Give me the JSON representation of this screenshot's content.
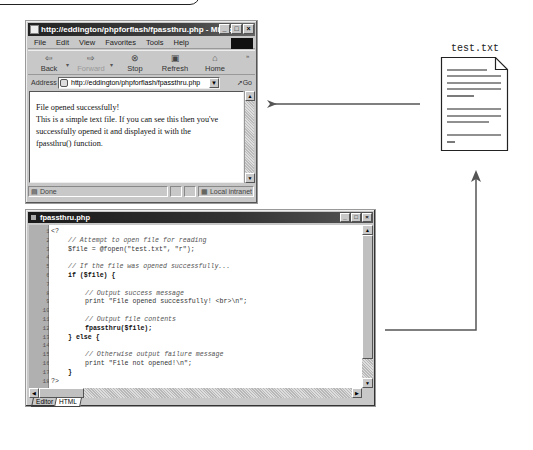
{
  "browser": {
    "title": "http://eddington/phpforflash/fpassthru.php - Micro...",
    "window_buttons": [
      "_",
      "□",
      "×"
    ],
    "menu": [
      "File",
      "Edit",
      "View",
      "Favorites",
      "Tools",
      "Help"
    ],
    "toolbar": {
      "back": "Back",
      "forward": "Forward",
      "stop": "Stop",
      "refresh": "Refresh",
      "home": "Home"
    },
    "address_label": "Address",
    "address_value": "http://eddington/phpforflash/fpassthru.php",
    "go_label": "Go",
    "content_lines": [
      "File opened successfully!",
      "This is a simple text file. If you can see this then you've",
      "successfully opened it and displayed it with the",
      "fpassthru() function."
    ],
    "status_text": "Done",
    "zone_text": "Local intranet"
  },
  "document": {
    "label": "test.txt"
  },
  "editor": {
    "title": "fpassthru.php",
    "window_buttons": [
      "_",
      "□",
      "×"
    ],
    "lines": [
      {
        "n": "1",
        "text": "<?",
        "type": "plain",
        "indent": 0
      },
      {
        "n": "2",
        "text": "// Attempt to open file for reading",
        "type": "cmt",
        "indent": 1
      },
      {
        "n": "3",
        "text": "$file = @fopen(\"test.txt\", \"r\");",
        "type": "plain",
        "indent": 1
      },
      {
        "n": "4",
        "text": "",
        "type": "plain",
        "indent": 0
      },
      {
        "n": "5",
        "text": "// If the file was opened successfully...",
        "type": "cmt",
        "indent": 1
      },
      {
        "n": "6",
        "text": "if ($file) {",
        "type": "kw",
        "indent": 1
      },
      {
        "n": "7",
        "text": "",
        "type": "plain",
        "indent": 0
      },
      {
        "n": "8",
        "text": "// Output success message",
        "type": "cmt",
        "indent": 2
      },
      {
        "n": "9",
        "text": "print \"File opened successfully! <br>\\n\";",
        "type": "plain",
        "indent": 2
      },
      {
        "n": "10",
        "text": "",
        "type": "plain",
        "indent": 0
      },
      {
        "n": "11",
        "text": "// Output file contents",
        "type": "cmt",
        "indent": 2
      },
      {
        "n": "12",
        "text": "fpassthru($file);",
        "type": "kw",
        "indent": 2
      },
      {
        "n": "13",
        "text": "} else {",
        "type": "kw",
        "indent": 1
      },
      {
        "n": "14",
        "text": "",
        "type": "plain",
        "indent": 0
      },
      {
        "n": "15",
        "text": "// Otherwise output failure message",
        "type": "cmt",
        "indent": 2
      },
      {
        "n": "16",
        "text": "print \"File not opened!\\n\";",
        "type": "plain",
        "indent": 2
      },
      {
        "n": "17",
        "text": "}",
        "type": "kw",
        "indent": 1
      },
      {
        "n": "18",
        "text": "?>",
        "type": "plain",
        "indent": 0
      }
    ],
    "tabs": [
      "Editor",
      "HTML"
    ],
    "active_tab": "HTML"
  },
  "arrows": {
    "file_to_browser": "left arrow from test.txt to browser output",
    "editor_to_file": "arrow from fpassthru.php editor up to test.txt"
  },
  "colors": {
    "window_chrome": "#c8c8c8",
    "titlebar": "#222222",
    "arrow": "#555555"
  }
}
